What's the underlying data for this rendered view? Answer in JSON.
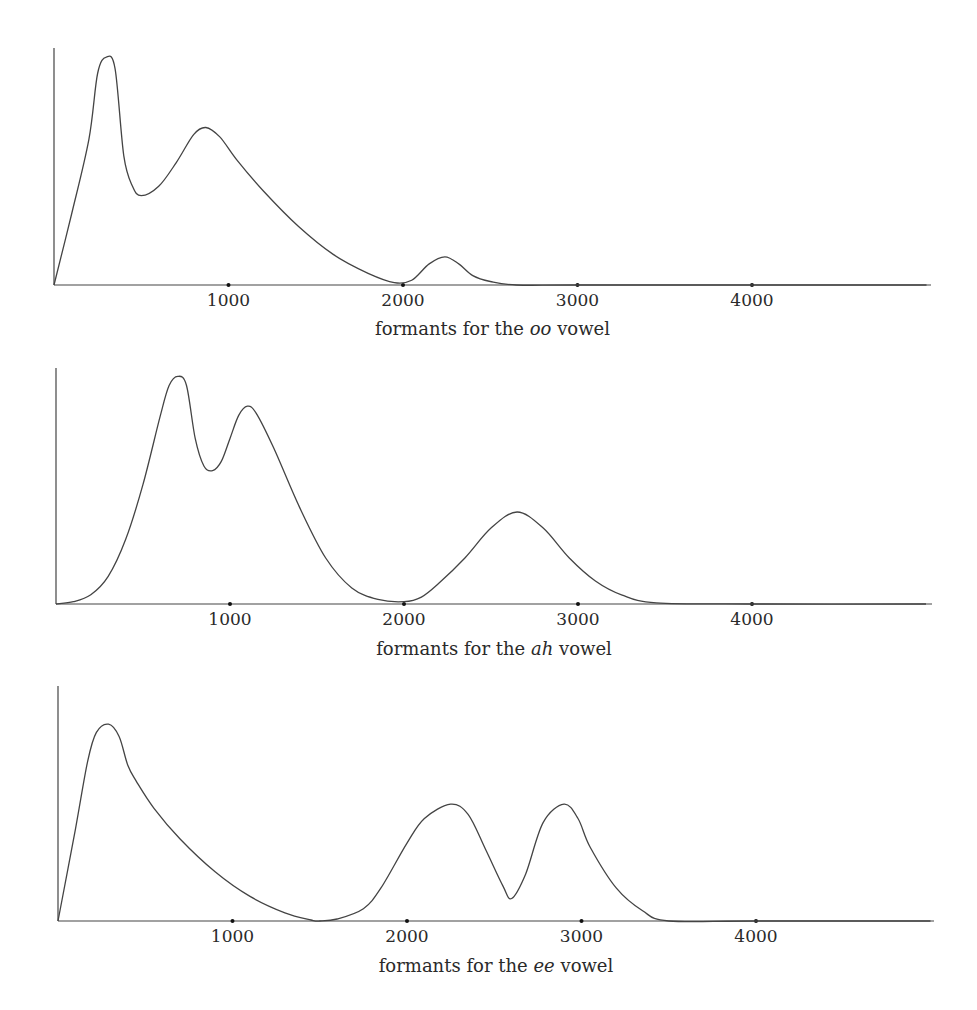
{
  "chart_data": [
    {
      "type": "line",
      "title": "",
      "caption": {
        "prefix": "formants for the ",
        "vowel": "oo",
        "suffix": " vowel"
      },
      "xlabel": "frequency (Hz)",
      "ylabel": "",
      "xlim": [
        0,
        5000
      ],
      "ylim": [
        0,
        1
      ],
      "grid": false,
      "x_ticks": [
        1000,
        2000,
        3000,
        4000
      ],
      "x_tick_labels": [
        "1000",
        "2000",
        "3000",
        "4000"
      ],
      "peaks_hz": [
        300,
        870,
        2240
      ],
      "x": [
        0,
        100,
        200,
        250,
        300,
        350,
        400,
        450,
        500,
        600,
        700,
        800,
        870,
        950,
        1050,
        1200,
        1400,
        1600,
        1800,
        1950,
        2050,
        2150,
        2240,
        2320,
        2400,
        2500,
        2650,
        3000,
        4000,
        5000
      ],
      "values": [
        0,
        0.3,
        0.62,
        0.9,
        0.97,
        0.92,
        0.55,
        0.42,
        0.38,
        0.42,
        0.52,
        0.64,
        0.67,
        0.63,
        0.53,
        0.4,
        0.25,
        0.13,
        0.05,
        0.01,
        0.02,
        0.09,
        0.12,
        0.09,
        0.04,
        0.015,
        0.0,
        0,
        0,
        0
      ]
    },
    {
      "type": "line",
      "title": "",
      "caption": {
        "prefix": "formants for the ",
        "vowel": "ah",
        "suffix": " vowel"
      },
      "xlabel": "frequency (Hz)",
      "ylabel": "",
      "xlim": [
        0,
        5000
      ],
      "ylim": [
        0,
        1
      ],
      "grid": false,
      "x_ticks": [
        1000,
        2000,
        3000,
        4000
      ],
      "x_tick_labels": [
        "1000",
        "2000",
        "3000",
        "4000"
      ],
      "peaks_hz": [
        700,
        1100,
        2650
      ],
      "x": [
        0,
        100,
        200,
        300,
        400,
        500,
        600,
        650,
        700,
        750,
        800,
        850,
        900,
        950,
        1000,
        1050,
        1100,
        1150,
        1250,
        1400,
        1550,
        1700,
        1850,
        2000,
        2100,
        2200,
        2350,
        2500,
        2650,
        2800,
        2950,
        3100,
        3250,
        3450,
        4000,
        5000
      ],
      "values": [
        0,
        0.01,
        0.04,
        0.12,
        0.28,
        0.52,
        0.82,
        0.95,
        0.99,
        0.95,
        0.72,
        0.6,
        0.58,
        0.62,
        0.72,
        0.82,
        0.86,
        0.83,
        0.68,
        0.42,
        0.2,
        0.07,
        0.02,
        0.01,
        0.03,
        0.09,
        0.2,
        0.33,
        0.4,
        0.33,
        0.2,
        0.1,
        0.04,
        0.005,
        0,
        0
      ]
    },
    {
      "type": "line",
      "title": "",
      "caption": {
        "prefix": "formants for the ",
        "vowel": "ee",
        "suffix": " vowel"
      },
      "xlabel": "frequency (Hz)",
      "ylabel": "",
      "xlim": [
        0,
        5000
      ],
      "ylim": [
        0,
        1
      ],
      "grid": false,
      "x_ticks": [
        1000,
        2000,
        3000,
        4000
      ],
      "x_tick_labels": [
        "1000",
        "2000",
        "3000",
        "4000"
      ],
      "peaks_hz": [
        290,
        2250,
        2900
      ],
      "x": [
        0,
        100,
        170,
        220,
        290,
        350,
        400,
        450,
        550,
        700,
        900,
        1100,
        1300,
        1450,
        1500,
        1600,
        1750,
        1850,
        2000,
        2100,
        2250,
        2350,
        2450,
        2550,
        2600,
        2680,
        2780,
        2900,
        2980,
        3050,
        3200,
        3350,
        3500,
        4000,
        5000
      ],
      "values": [
        0,
        0.45,
        0.78,
        0.92,
        0.96,
        0.9,
        0.76,
        0.68,
        0.55,
        0.4,
        0.24,
        0.12,
        0.04,
        0.005,
        0.0,
        0.01,
        0.06,
        0.16,
        0.38,
        0.5,
        0.57,
        0.52,
        0.35,
        0.17,
        0.11,
        0.23,
        0.48,
        0.57,
        0.5,
        0.36,
        0.16,
        0.05,
        0.0,
        0,
        0
      ]
    }
  ],
  "figure": {
    "plots": [
      {
        "origin_x": 54,
        "baseline_y": 285,
        "top_y": 48,
        "axis_end_x": 931,
        "px_per_1000": 174.5,
        "height_px": 235,
        "caption_y": 335
      },
      {
        "origin_x": 56,
        "baseline_y": 604,
        "top_y": 368,
        "axis_end_x": 932,
        "px_per_1000": 174,
        "height_px": 230,
        "caption_y": 655
      },
      {
        "origin_x": 58,
        "baseline_y": 921,
        "top_y": 686,
        "axis_end_x": 934,
        "px_per_1000": 174.5,
        "height_px": 205,
        "caption_y": 972
      }
    ]
  }
}
